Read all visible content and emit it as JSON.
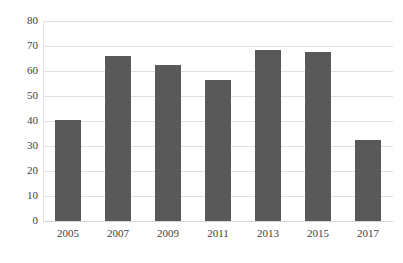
{
  "chart_data": {
    "type": "bar",
    "title": "",
    "subtitle": "",
    "xlabel": "",
    "ylabel": "",
    "categories": [
      "2005",
      "2007",
      "2009",
      "2011",
      "2013",
      "2015",
      "2017"
    ],
    "values": [
      40.3,
      66.2,
      62.6,
      56.3,
      68.6,
      67.8,
      32.4
    ],
    "series": [
      {
        "name": "",
        "values": [
          40.3,
          66.2,
          62.6,
          56.3,
          68.6,
          67.8,
          32.4
        ]
      }
    ],
    "ylim": [
      0,
      80
    ],
    "ytick_labels": [
      "0",
      "10",
      "20",
      "30",
      "40",
      "50",
      "60",
      "70",
      "80"
    ],
    "ytick_values": [
      0,
      10,
      20,
      30,
      40,
      50,
      60,
      70,
      80
    ],
    "grid": true,
    "grid_axis": "y",
    "legend": false,
    "legend_position": "none",
    "bar_color": "#595959",
    "gridline_color": "#e2e2e2",
    "background_color": "#ffffff",
    "text_color": "#404040",
    "annotations": []
  }
}
